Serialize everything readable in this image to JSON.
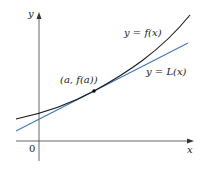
{
  "figure": {
    "axes": {
      "x_label": "x",
      "y_label": "y",
      "origin_label": "0"
    },
    "curve": {
      "label": "y = f(x)",
      "color": "#1a1a1a"
    },
    "tangent_line": {
      "label": "y = L(x)",
      "color": "#3f76b8"
    },
    "point": {
      "label": "(a, f(a))",
      "color": "#000000"
    }
  }
}
